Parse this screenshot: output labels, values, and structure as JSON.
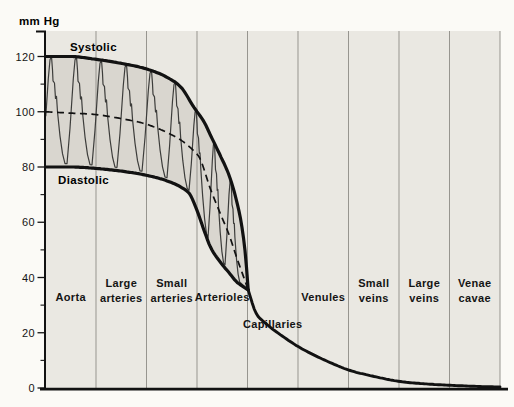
{
  "figure": {
    "unit_label": "mm Hg",
    "curve_labels": {
      "systolic": "Systolic",
      "diastolic": "Diastolic"
    }
  },
  "chart_data": {
    "type": "line",
    "ylabel": "mm Hg",
    "ylim": [
      0,
      129
    ],
    "x_axis": "vessel segments, categorical, equal column widths, vertical separator gridlines",
    "yticks_major": [
      0,
      20,
      40,
      60,
      80,
      100,
      120
    ],
    "yticks_minor": [
      10,
      30,
      50,
      70,
      90,
      110
    ],
    "categories": [
      "Aorta",
      "Large arteries",
      "Small arteries",
      "Arterioles",
      "Capillaries",
      "Venules",
      "Small veins",
      "Large veins",
      "Venae cavae"
    ],
    "category_label_lines": [
      [
        "Aorta"
      ],
      [
        "Large",
        "arteries"
      ],
      [
        "Small",
        "arteries"
      ],
      [
        "Arterioles"
      ],
      [
        "Capillaries"
      ],
      [
        "Venules"
      ],
      [
        "Small",
        "veins"
      ],
      [
        "Large",
        "veins"
      ],
      [
        "Venae",
        "cavae"
      ]
    ],
    "series": [
      {
        "name": "Systolic",
        "style": "thick-solid",
        "x_frac": [
          0,
          0.055,
          0.11,
          0.167,
          0.222,
          0.267,
          0.3,
          0.325,
          0.35,
          0.363,
          0.385,
          0.405,
          0.42,
          0.432,
          0.44,
          0.446
        ],
        "mm_hg": [
          120,
          120,
          119,
          117.5,
          115.5,
          112.5,
          108.5,
          102,
          96,
          91.5,
          84,
          76.5,
          68,
          58.5,
          48,
          35.5
        ]
      },
      {
        "name": "Diastolic",
        "style": "thick-solid",
        "x_frac": [
          0,
          0.055,
          0.11,
          0.167,
          0.222,
          0.267,
          0.3,
          0.318,
          0.334,
          0.35,
          0.363,
          0.385,
          0.405,
          0.42,
          0.432,
          0.446
        ],
        "mm_hg": [
          80,
          80,
          79.5,
          78.5,
          77,
          75,
          72.5,
          70,
          64,
          56.5,
          51,
          45.5,
          41.5,
          38.5,
          37,
          35.5
        ]
      },
      {
        "name": "Mean",
        "style": "dashed",
        "x_frac": [
          0,
          0.055,
          0.11,
          0.167,
          0.222,
          0.267,
          0.3,
          0.325,
          0.34,
          0.363,
          0.385,
          0.405,
          0.42,
          0.432,
          0.446
        ],
        "mm_hg": [
          100,
          99.5,
          99,
          97.5,
          95.5,
          92.5,
          89.5,
          86,
          83,
          72,
          63,
          55,
          47.5,
          42,
          35.5
        ]
      },
      {
        "name": "Venous",
        "style": "thick-solid",
        "x_frac": [
          0.446,
          0.462,
          0.484,
          0.515,
          0.556,
          0.6,
          0.635,
          0.667,
          0.72,
          0.778,
          0.835,
          0.889,
          0.945,
          1.0
        ],
        "mm_hg": [
          35.5,
          27.5,
          23.5,
          19.5,
          15,
          11.2,
          8.6,
          6.5,
          4.3,
          2.4,
          1.5,
          1.0,
          0.6,
          0.35
        ]
      }
    ],
    "annotations": [
      {
        "label": "85 mm",
        "value_mm_hg": 85,
        "x_frac": 0.34,
        "series": "Mean"
      },
      {
        "label": "35 mm",
        "value_mm_hg": 35,
        "x_frac": 0.446,
        "series": "Venous"
      },
      {
        "label": "15 mm",
        "value_mm_hg": 15,
        "x_frac": 0.556,
        "series": "Venous"
      },
      {
        "label": "6 mm",
        "value_mm_hg": 6,
        "x_frac": 0.667,
        "series": "Venous"
      },
      {
        "label": "2 mm",
        "value_mm_hg": 2,
        "x_frac": 0.778,
        "series": "Venous"
      },
      {
        "label": "1 mm",
        "value_mm_hg": 1,
        "x_frac": 0.889,
        "series": "Venous"
      }
    ],
    "pulse_wave": {
      "cycles": 9,
      "oscillates_between": [
        "Diastolic",
        "Systolic"
      ]
    },
    "legend": "none"
  },
  "colors": {
    "page_background": "#fbfaf6",
    "plot_background": "#eae8e2",
    "pulse_band": "#d9d6cf",
    "curve": "#121212",
    "pulse_line": "#3d3d3b",
    "grid_line": "#97958f",
    "text": "#141414"
  }
}
